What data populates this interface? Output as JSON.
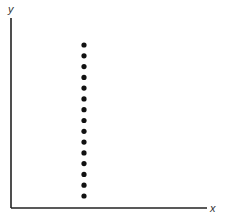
{
  "chart_data": {
    "type": "scatter",
    "title": "",
    "xlabel": "x",
    "ylabel": "y",
    "grid": false,
    "legend": null,
    "points": [
      {
        "x": 0.37,
        "y": 0.93
      },
      {
        "x": 0.37,
        "y": 0.87
      },
      {
        "x": 0.37,
        "y": 0.81
      },
      {
        "x": 0.37,
        "y": 0.75
      },
      {
        "x": 0.37,
        "y": 0.63
      },
      {
        "x": 0.37,
        "y": 0.69
      },
      {
        "x": 0.37,
        "y": 0.57
      },
      {
        "x": 0.37,
        "y": 0.51
      },
      {
        "x": 0.37,
        "y": 0.45
      },
      {
        "x": 0.37,
        "y": 0.39
      },
      {
        "x": 0.37,
        "y": 0.33
      },
      {
        "x": 0.37,
        "y": 0.27
      },
      {
        "x": 0.37,
        "y": 0.21
      },
      {
        "x": 0.37,
        "y": 0.15
      },
      {
        "x": 0.37,
        "y": 0.09
      }
    ],
    "xlim": [
      0,
      1
    ],
    "ylim": [
      0,
      1
    ]
  },
  "axes": {
    "x_label": "x",
    "y_label": "y",
    "color": "#222222"
  },
  "dot_color": "#111111"
}
